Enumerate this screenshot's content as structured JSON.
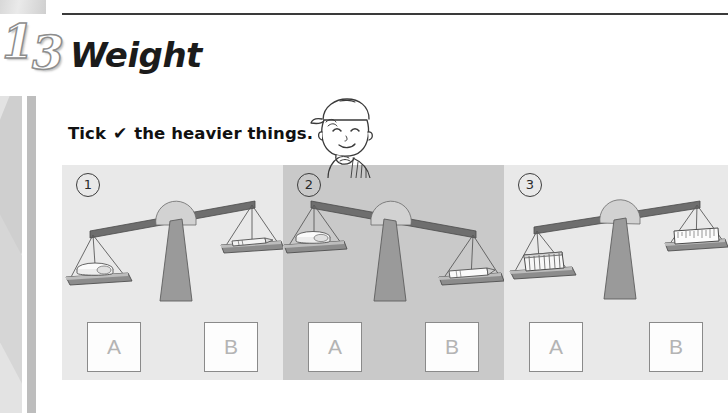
{
  "page": {
    "chapter_number": "13",
    "chapter_digit_1": "1",
    "chapter_digit_2": "3",
    "title": "Weight",
    "instruction_before": "Tick",
    "instruction_tick": "✔",
    "instruction_after": "the heavier things."
  },
  "illustration": {
    "character": "thinking-boy-with-cap"
  },
  "colors": {
    "panel_light": "#e9e9e9",
    "panel_dark": "#c9c9c9",
    "beam": "#6e6e6e",
    "fulcrum": "#9a9a9a",
    "pan": "#7d7d7d",
    "box_border": "#8a8a8a",
    "box_letter": "#b4b4b4",
    "rule": "#3a3a3a"
  },
  "questions": [
    {
      "number": "1",
      "background": "light",
      "heavier_side": "left",
      "left": {
        "label": "A",
        "object": "eraser",
        "position": "down"
      },
      "right": {
        "label": "B",
        "object": "pencil",
        "position": "up"
      }
    },
    {
      "number": "2",
      "background": "dark",
      "heavier_side": "right",
      "left": {
        "label": "A",
        "object": "eraser",
        "position": "up"
      },
      "right": {
        "label": "B",
        "object": "chalk",
        "position": "down"
      }
    },
    {
      "number": "3",
      "background": "light",
      "heavier_side": "left",
      "left": {
        "label": "A",
        "object": "box-of-crayons",
        "position": "down"
      },
      "right": {
        "label": "B",
        "object": "ruler",
        "position": "up"
      }
    }
  ]
}
